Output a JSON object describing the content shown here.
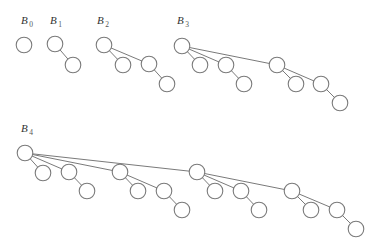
{
  "diagram": {
    "node_radius": 7.8,
    "colors": {
      "stroke": "#7a7a7a",
      "node_fill": "#ffffff",
      "label": "#333333",
      "background": "#ffffff"
    },
    "trees": [
      {
        "id": "B0",
        "label_main": "B",
        "label_sub": "0",
        "label_pos": [
          21,
          24
        ],
        "nodes": [
          {
            "id": "r",
            "x": 24,
            "y": 45
          }
        ],
        "edges": []
      },
      {
        "id": "B1",
        "label_main": "B",
        "label_sub": "1",
        "label_pos": [
          50,
          24
        ],
        "nodes": [
          {
            "id": "r",
            "x": 55,
            "y": 44
          },
          {
            "id": "a",
            "x": 73,
            "y": 65
          }
        ],
        "edges": [
          [
            "r",
            "a"
          ]
        ]
      },
      {
        "id": "B2",
        "label_main": "B",
        "label_sub": "2",
        "label_pos": [
          97,
          24
        ],
        "nodes": [
          {
            "id": "r",
            "x": 104,
            "y": 45
          },
          {
            "id": "a",
            "x": 123,
            "y": 65
          },
          {
            "id": "b",
            "x": 149,
            "y": 64
          },
          {
            "id": "ba",
            "x": 167,
            "y": 84
          }
        ],
        "edges": [
          [
            "r",
            "a"
          ],
          [
            "r",
            "b"
          ],
          [
            "b",
            "ba"
          ]
        ]
      },
      {
        "id": "B3",
        "label_main": "B",
        "label_sub": "3",
        "label_pos": [
          177,
          24
        ],
        "nodes": [
          {
            "id": "r",
            "x": 182,
            "y": 46
          },
          {
            "id": "a",
            "x": 200,
            "y": 65
          },
          {
            "id": "b",
            "x": 226,
            "y": 65
          },
          {
            "id": "ba",
            "x": 244,
            "y": 84
          },
          {
            "id": "c",
            "x": 277,
            "y": 65
          },
          {
            "id": "ca",
            "x": 296,
            "y": 84
          },
          {
            "id": "cb",
            "x": 321,
            "y": 84
          },
          {
            "id": "cba",
            "x": 340,
            "y": 103
          }
        ],
        "edges": [
          [
            "r",
            "a"
          ],
          [
            "r",
            "b"
          ],
          [
            "r",
            "c"
          ],
          [
            "b",
            "ba"
          ],
          [
            "c",
            "ca"
          ],
          [
            "c",
            "cb"
          ],
          [
            "cb",
            "cba"
          ]
        ]
      },
      {
        "id": "B4",
        "label_main": "B",
        "label_sub": "4",
        "label_pos": [
          21,
          132
        ],
        "nodes": [
          {
            "id": "r",
            "x": 25,
            "y": 153
          },
          {
            "id": "a",
            "x": 43,
            "y": 173
          },
          {
            "id": "b",
            "x": 69,
            "y": 172
          },
          {
            "id": "ba",
            "x": 87,
            "y": 191
          },
          {
            "id": "c",
            "x": 120,
            "y": 172
          },
          {
            "id": "ca",
            "x": 138,
            "y": 191
          },
          {
            "id": "cb",
            "x": 164,
            "y": 191
          },
          {
            "id": "cba",
            "x": 182,
            "y": 210
          },
          {
            "id": "d",
            "x": 197,
            "y": 172
          },
          {
            "id": "da",
            "x": 215,
            "y": 191
          },
          {
            "id": "db",
            "x": 241,
            "y": 191
          },
          {
            "id": "dba",
            "x": 259,
            "y": 210
          },
          {
            "id": "dc",
            "x": 292,
            "y": 191
          },
          {
            "id": "dca",
            "x": 311,
            "y": 210
          },
          {
            "id": "dcb",
            "x": 337,
            "y": 210
          },
          {
            "id": "dcba",
            "x": 356,
            "y": 229
          }
        ],
        "edges": [
          [
            "r",
            "a"
          ],
          [
            "r",
            "b"
          ],
          [
            "r",
            "c"
          ],
          [
            "r",
            "d"
          ],
          [
            "b",
            "ba"
          ],
          [
            "c",
            "ca"
          ],
          [
            "c",
            "cb"
          ],
          [
            "cb",
            "cba"
          ],
          [
            "d",
            "da"
          ],
          [
            "d",
            "db"
          ],
          [
            "d",
            "dc"
          ],
          [
            "db",
            "dba"
          ],
          [
            "dc",
            "dca"
          ],
          [
            "dc",
            "dcb"
          ],
          [
            "dcb",
            "dcba"
          ]
        ]
      }
    ]
  }
}
